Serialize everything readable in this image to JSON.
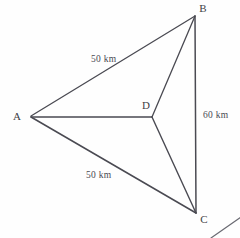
{
  "figure": {
    "kind": "geometry-diagram",
    "background_color": "#fefefe",
    "stroke_color": "#4a4a52",
    "label_color": "#3e3e46",
    "width": 240,
    "height": 238
  },
  "vertices": {
    "a": {
      "label": "A",
      "x": 31,
      "y": 116,
      "label_x": 17,
      "label_y": 120
    },
    "b": {
      "label": "B",
      "x": 195,
      "y": 16,
      "label_x": 201,
      "label_y": 12
    },
    "c": {
      "label": "C",
      "x": 196,
      "y": 213,
      "label_x": 202,
      "label_y": 222
    },
    "d": {
      "label": "D",
      "x": 152,
      "y": 117,
      "label_x": 143,
      "label_y": 109
    }
  },
  "edges": [
    {
      "name": "edge-a-b",
      "from": "A",
      "to": "B",
      "x1": 31,
      "y1": 116,
      "x2": 195,
      "y2": 16
    },
    {
      "name": "edge-a-c",
      "from": "A",
      "to": "C",
      "x1": 31,
      "y1": 116,
      "x2": 196,
      "y2": 213
    },
    {
      "name": "edge-a-d",
      "from": "A",
      "to": "D",
      "x1": 31,
      "y1": 117,
      "x2": 152,
      "y2": 117
    },
    {
      "name": "edge-d-b",
      "from": "D",
      "to": "B",
      "x1": 152,
      "y1": 117,
      "x2": 195,
      "y2": 16
    },
    {
      "name": "edge-d-c",
      "from": "D",
      "to": "C",
      "x1": 152,
      "y1": 117,
      "x2": 196,
      "y2": 213
    },
    {
      "name": "edge-b-c",
      "from": "B",
      "to": "C",
      "x1": 195,
      "y1": 16,
      "x2": 196,
      "y2": 213
    }
  ],
  "measurements": [
    {
      "name": "measure-ab",
      "text": "50 km",
      "edge": "A-B",
      "x": 91,
      "y": 62,
      "anchor": "start"
    },
    {
      "name": "measure-ac",
      "text": "50 km",
      "edge": "A-C",
      "x": 86,
      "y": 178,
      "anchor": "start"
    },
    {
      "name": "measure-bc",
      "text": "60 km",
      "edge": "B-C",
      "x": 203,
      "y": 118,
      "anchor": "start"
    }
  ],
  "stray_marks": [
    {
      "name": "corner-line-fragment",
      "x1": 211,
      "y1": 238,
      "x2": 241,
      "y2": 217
    }
  ]
}
